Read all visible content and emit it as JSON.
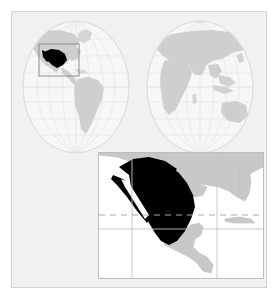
{
  "figure": {
    "background_color": "#ffffff",
    "panel_color": "#f1f1f1",
    "panel_border_color": "#d2d2d2"
  },
  "colors": {
    "ocean": "#ffffff",
    "globe_fill": "#f6f6f6",
    "globe_graticule": "#e0e0e0",
    "globe_outline": "#dcdcdc",
    "land": "#c8c8c8",
    "land_light": "#d9d9d9",
    "land_outline": "#b4b4b4",
    "highlight": "#000000",
    "grid_line": "#c0c0c0",
    "tropic_line": "#a8a8a8",
    "locator_box": "#8c8c8c",
    "inset_border": "#bdbdbd"
  },
  "globes": {
    "west": {
      "label": "Western Hemisphere",
      "center_x": 64,
      "center_y": 70,
      "radius_x": 56,
      "radius_y": 68,
      "continents": [
        "North America",
        "South America",
        "Greenland"
      ],
      "highlight_country": "Mexico",
      "locator_box": {
        "x": 37,
        "y": 37,
        "width": 31,
        "height": 28
      }
    },
    "east": {
      "label": "Eastern Hemisphere",
      "center_x": 188,
      "center_y": 70,
      "radius_x": 56,
      "radius_y": 68,
      "continents": [
        "Europe",
        "Africa",
        "Asia",
        "Australia"
      ],
      "highlight_country": null
    },
    "graticule": {
      "parallels": 7,
      "meridians": 7,
      "visible": true
    }
  },
  "inset": {
    "label": "Detail map of Mexico",
    "highlight_country": "Mexico",
    "neighbor_regions": [
      "United States",
      "Guatemala",
      "Belize",
      "Honduras",
      "Nicaragua",
      "Cuba",
      "Florida"
    ],
    "water_bodies": [
      "Pacific Ocean",
      "Gulf of Mexico",
      "Gulf of California",
      "Caribbean Sea"
    ],
    "grid": {
      "vertical_lines_x": [
        33,
        118
      ],
      "horizontal_lines_y": [
        76
      ],
      "tropic_of_cancer_y": 62,
      "tropic_style": "dashed"
    }
  }
}
